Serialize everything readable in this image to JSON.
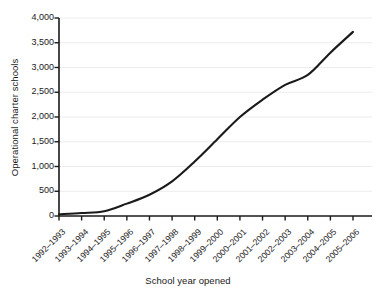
{
  "chart_data": {
    "type": "line",
    "title": "",
    "xlabel": "School year opened",
    "ylabel": "Operational charter schools",
    "categories": [
      "1992–1993",
      "1993–1994",
      "1994–1995",
      "1995–1996",
      "1996–1997",
      "1997–1998",
      "1998–1999",
      "1999–2000",
      "2000–2001",
      "2001–2002",
      "2002–2003",
      "2003–2004",
      "2004–2005",
      "2005–2006"
    ],
    "values": [
      35,
      60,
      95,
      250,
      430,
      700,
      1100,
      1550,
      2000,
      2350,
      2650,
      2850,
      3300,
      3720
    ],
    "series": [
      {
        "name": "Operational charter schools",
        "values": [
          35,
          60,
          95,
          250,
          430,
          700,
          1100,
          1550,
          2000,
          2350,
          2650,
          2850,
          3300,
          3720
        ]
      }
    ],
    "ylim": [
      0,
      4000
    ],
    "ytick_values": [
      0,
      500,
      1000,
      1500,
      2000,
      2500,
      3000,
      3500,
      4000
    ],
    "ytick_labels": [
      "0",
      "500",
      "1,000",
      "1,500",
      "2,000",
      "2,500",
      "3,000",
      "3,500",
      "4,000"
    ],
    "grid": "horizontal",
    "legend": "none",
    "line_color": "#1a1a1a",
    "grid_color": "#ececec",
    "axis_color": "#1a1a1a",
    "background": "#ffffff"
  }
}
